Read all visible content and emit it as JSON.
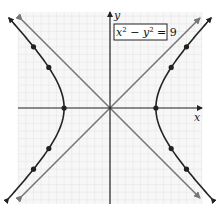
{
  "chart_data": {
    "type": "line",
    "title": "",
    "equation_label": "x² − y² = 9",
    "equation_parts": {
      "x": "x",
      "x_exp": "2",
      "minus": " − ",
      "y": "y",
      "y_exp": "2",
      "rhs": " = 9"
    },
    "xlabel": "x",
    "ylabel": "y",
    "xlim": [
      -6,
      6
    ],
    "ylim": [
      -6.3,
      6.3
    ],
    "grid": true,
    "grid_step": 1,
    "legend": null,
    "series": [
      {
        "name": "hyperbola x^2 - y^2 = 9 (right branch)",
        "kind": "curve",
        "color": "#222222",
        "points": [
          [
            3,
            0
          ],
          [
            4,
            2.65
          ],
          [
            5,
            4
          ],
          [
            4,
            -2.65
          ],
          [
            5,
            -4
          ]
        ]
      },
      {
        "name": "hyperbola x^2 - y^2 = 9 (left branch)",
        "kind": "curve",
        "color": "#222222",
        "points": [
          [
            -3,
            0
          ],
          [
            -4,
            2.65
          ],
          [
            -5,
            4
          ],
          [
            -4,
            -2.65
          ],
          [
            -5,
            -4
          ]
        ]
      },
      {
        "name": "asymptote y = x",
        "kind": "line",
        "color": "#777777"
      },
      {
        "name": "asymptote y = -x",
        "kind": "line",
        "color": "#777777"
      }
    ],
    "marked_points": [
      [
        3,
        0
      ],
      [
        -3,
        0
      ],
      [
        4,
        2.65
      ],
      [
        5,
        4
      ],
      [
        4,
        -2.65
      ],
      [
        5,
        -4
      ],
      [
        -4,
        2.65
      ],
      [
        -5,
        4
      ],
      [
        -4,
        -2.65
      ],
      [
        -5,
        -4
      ]
    ],
    "vertices": [
      [
        -3,
        0
      ],
      [
        3,
        0
      ]
    ]
  },
  "colors": {
    "curve": "#222222",
    "asymptote": "#777777",
    "axis": "#222222",
    "grid": "#e6e6e6",
    "background": "#f7f7f7"
  }
}
